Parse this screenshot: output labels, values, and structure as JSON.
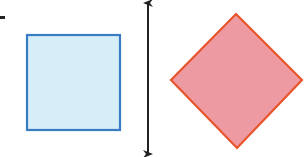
{
  "diagram": {
    "marker": {
      "color": "#222222"
    },
    "square": {
      "fill": "#d6eef8",
      "stroke": "#3a7cc4"
    },
    "mirror_line": {
      "color": "#222222",
      "arrows": "both-ends"
    },
    "diamond": {
      "fill": "#ee9aa2",
      "stroke": "#e8542a"
    }
  }
}
